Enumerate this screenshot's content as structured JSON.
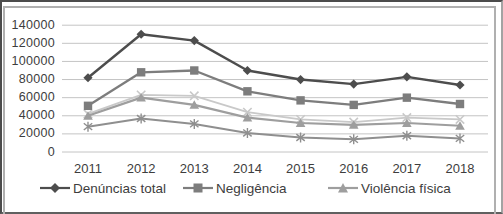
{
  "chart_data": {
    "type": "line",
    "title": "",
    "xlabel": "",
    "ylabel": "",
    "x_labels": [
      "2011",
      "2012",
      "2013",
      "2014",
      "2015",
      "2016",
      "2017",
      "2018"
    ],
    "y_tick_labels": [
      "0",
      "20000",
      "40000",
      "60000",
      "80000",
      "100000",
      "120000",
      "140000"
    ],
    "ylim": [
      0,
      140000
    ],
    "y_tick_step": 20000,
    "grid": true,
    "legend_position": "bottom",
    "series": [
      {
        "name": "",
        "marker": "x",
        "color": "#c9c9c9",
        "line_width": 1.8,
        "values": [
          42000,
          63000,
          62000,
          44000,
          36000,
          33000,
          38000,
          36000
        ],
        "in_legend": false
      },
      {
        "name": "",
        "marker": "asterisk",
        "color": "#8f8f8f",
        "line_width": 2,
        "values": [
          28000,
          37000,
          31000,
          21000,
          16000,
          14000,
          18000,
          15000
        ],
        "in_legend": false
      },
      {
        "name": "Violência física",
        "marker": "triangle",
        "color": "#9e9e9e",
        "line_width": 2.2,
        "values": [
          40000,
          60000,
          52000,
          38000,
          32000,
          30000,
          32000,
          29000
        ],
        "in_legend": true
      },
      {
        "name": "Negligência",
        "marker": "square",
        "color": "#7d7d7d",
        "line_width": 2.3,
        "values": [
          51000,
          88000,
          90000,
          67000,
          57000,
          52000,
          60000,
          53000
        ],
        "in_legend": true
      },
      {
        "name": "Denúncias total",
        "marker": "diamond",
        "color": "#4d4d4d",
        "line_width": 2.4,
        "values": [
          82000,
          130000,
          123000,
          90000,
          80000,
          75000,
          83000,
          74000
        ],
        "in_legend": true
      }
    ],
    "legend": [
      {
        "label": "Denúncias total",
        "marker": "diamond"
      },
      {
        "label": "Negligência",
        "marker": "square"
      },
      {
        "label": "Violência física",
        "marker": "triangle"
      }
    ]
  },
  "colors": {
    "grid": "#c4c4c4",
    "text": "#3d3d3d",
    "frame": "#b0b0b0",
    "background": "#ffffff"
  }
}
